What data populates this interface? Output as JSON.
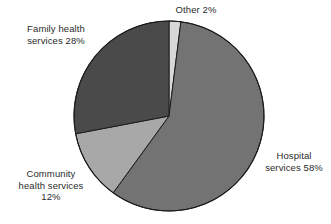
{
  "chart_data": {
    "type": "pie",
    "title": "",
    "subtitle": "",
    "xlabel": "",
    "ylabel": "",
    "legend_position": "none",
    "grid": false,
    "start_angle_deg": 0,
    "direction": "clockwise",
    "categories": [
      "Other",
      "Hospital services",
      "Community health services",
      "Family health services"
    ],
    "values": [
      2,
      58,
      12,
      28
    ],
    "units": "percent",
    "total": 100,
    "slices": [
      {
        "name": "Other",
        "value": 2,
        "label": "Other 2%",
        "color": "#d8d8d8",
        "start_deg": 0,
        "end_deg": 7.2
      },
      {
        "name": "Hospital services",
        "value": 58,
        "label": "Hospital\nservices 58%",
        "color": "#737373",
        "start_deg": 7.2,
        "end_deg": 216
      },
      {
        "name": "Community health services",
        "value": 12,
        "label": "Community\nhealth services\n12%",
        "color": "#a8a8a8",
        "start_deg": 216,
        "end_deg": 259.2
      },
      {
        "name": "Family health services",
        "value": 28,
        "label": "Family health\nservices 28%",
        "color": "#4a4a4a",
        "start_deg": 259.2,
        "end_deg": 360
      }
    ]
  },
  "labels": {
    "family": "Family health\nservices 28%",
    "other": "Other 2%",
    "hospital": "Hospital\nservices 58%",
    "community": "Community\nhealth services\n12%"
  },
  "style": {
    "background": "#ffffff",
    "outline": "#1c1c1c",
    "text": "#2b2b2b"
  }
}
